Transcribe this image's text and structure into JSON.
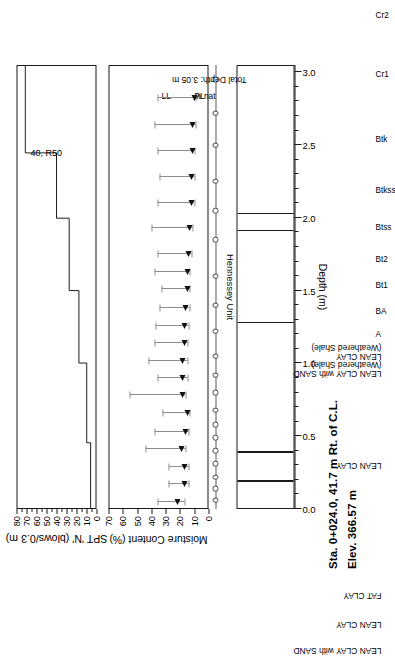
{
  "title": {
    "line1": "Sta. 0+024.0, 41.7 m Rt. of C.L.",
    "line2": "Elev.  366.57 m"
  },
  "chart_data": {
    "type": "line",
    "orientation": "rotated-90",
    "panels": [
      {
        "name": "spt",
        "type": "line",
        "title": "SPT 'N' (blows/0.3 m)",
        "ylabel": "SPT 'N' (blows/0.3 m)",
        "xlabel": "Depth (m)",
        "ylim": [
          0,
          80
        ],
        "yticks": [
          0,
          10,
          20,
          30,
          40,
          50,
          60,
          70,
          80
        ],
        "grid": false,
        "step_points": [
          {
            "depth_start": 0.0,
            "depth_end": 0.45,
            "n": 5
          },
          {
            "depth_start": 0.45,
            "depth_end": 1.0,
            "n": 9
          },
          {
            "depth_start": 1.0,
            "depth_end": 1.5,
            "n": 17
          },
          {
            "depth_start": 1.5,
            "depth_end": 2.0,
            "n": 27
          },
          {
            "depth_start": 2.0,
            "depth_end": 2.45,
            "n": 40
          },
          {
            "depth_start": 2.45,
            "depth_end": 3.05,
            "n": 72
          }
        ],
        "annotation": "40, R50"
      },
      {
        "name": "moisture",
        "type": "range",
        "title": "Moisture Content (%)",
        "ylabel": "Moisture Content (%)",
        "ylim": [
          0,
          70
        ],
        "yticks": [
          0,
          10,
          20,
          30,
          40,
          50,
          60,
          70
        ],
        "grid": false,
        "legend": [
          "LL",
          "PL",
          "w nat"
        ],
        "points": [
          {
            "depth": 0.05,
            "w_nat": 22,
            "PL": 17,
            "LL": 36
          },
          {
            "depth": 0.17,
            "w_nat": 17,
            "PL": 14,
            "LL": 28
          },
          {
            "depth": 0.29,
            "w_nat": 17,
            "PL": 14,
            "LL": 28
          },
          {
            "depth": 0.41,
            "w_nat": 19,
            "PL": 16,
            "LL": 44
          },
          {
            "depth": 0.53,
            "w_nat": 16,
            "PL": 14,
            "LL": 38
          },
          {
            "depth": 0.66,
            "w_nat": 15,
            "PL": 13,
            "LL": 32
          },
          {
            "depth": 0.78,
            "w_nat": 18,
            "PL": 16,
            "LL": 55
          },
          {
            "depth": 0.9,
            "w_nat": 18,
            "PL": 15,
            "LL": 36
          },
          {
            "depth": 1.02,
            "w_nat": 18,
            "PL": 15,
            "LL": 42
          },
          {
            "depth": 1.14,
            "w_nat": 17,
            "PL": 15,
            "LL": 38
          },
          {
            "depth": 1.26,
            "w_nat": 17,
            "PL": 14,
            "LL": 37
          },
          {
            "depth": 1.38,
            "w_nat": 16,
            "PL": 13,
            "LL": 34
          },
          {
            "depth": 1.51,
            "w_nat": 15,
            "PL": 13,
            "LL": 33
          },
          {
            "depth": 1.63,
            "w_nat": 15,
            "PL": 13,
            "LL": 38
          },
          {
            "depth": 1.75,
            "w_nat": 14,
            "PL": 12,
            "LL": 36
          },
          {
            "depth": 1.93,
            "w_nat": 13,
            "PL": 11,
            "LL": 40
          },
          {
            "depth": 2.1,
            "w_nat": 12,
            "PL": 10,
            "LL": 36
          },
          {
            "depth": 2.28,
            "w_nat": 12,
            "PL": 10,
            "LL": 34
          },
          {
            "depth": 2.46,
            "w_nat": 11,
            "PL": 10,
            "LL": 36
          },
          {
            "depth": 2.64,
            "w_nat": 11,
            "PL": 9,
            "LL": 38
          },
          {
            "depth": 2.82,
            "w_nat": 10,
            "PL": 9,
            "LL": 36
          }
        ]
      },
      {
        "name": "hennessey_unit",
        "type": "categorical",
        "title": "Hennessey Unit",
        "categories": [
          {
            "label": "A",
            "depth": 0.06
          },
          {
            "label": "BA",
            "depth": 0.22
          },
          {
            "label": "Bt1",
            "depth": 0.4
          },
          {
            "label": "Bt2",
            "depth": 0.58
          },
          {
            "label": "Btss",
            "depth": 0.8
          },
          {
            "label": "Btkss",
            "depth": 1.05
          },
          {
            "label": "Btk",
            "depth": 1.4
          },
          {
            "label": "Cr1",
            "depth": 1.85
          },
          {
            "label": "Cr2",
            "depth": 2.25
          }
        ],
        "extra_markers": [
          0.14,
          0.31,
          0.49,
          0.68,
          0.92,
          1.22,
          1.6,
          2.05,
          2.5,
          2.72,
          2.95
        ]
      },
      {
        "name": "soil_profile",
        "type": "profile",
        "xlabel": "Depth (m)",
        "xlim": [
          0.0,
          3.05
        ],
        "xticks": [
          "0.0",
          "0.5",
          "1.0",
          "1.5",
          "2.0",
          "2.5",
          "3.0"
        ],
        "total_depth_label": "Total Depth: 3.05 m",
        "layers": [
          {
            "label": "LEAN CLAY with SAND",
            "top": 0.0,
            "bottom": 0.18
          },
          {
            "label": "LEAN CLAY",
            "top": 0.18,
            "bottom": 0.38
          },
          {
            "label": "FAT CLAY",
            "top": 0.38,
            "bottom": 1.27
          },
          {
            "label": "LEAN CLAY",
            "top": 1.27,
            "bottom": 1.9
          },
          {
            "label": "LEAN CLAY with SAND (Weathered Shale)",
            "top": 1.9,
            "bottom": 2.02
          },
          {
            "label": "LEAN CLAY (Weathered Shale)",
            "top": 2.02,
            "bottom": 3.05
          }
        ]
      }
    ]
  }
}
